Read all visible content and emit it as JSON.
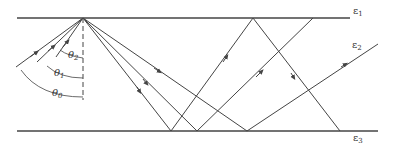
{
  "diagram": {
    "colors": {
      "line": "#444444",
      "background": "#ffffff"
    },
    "layers": [
      {
        "label_base": "ε",
        "label_sub": "1",
        "position": "upper medium"
      },
      {
        "label_base": "ε",
        "label_sub": "2",
        "position": "middle layer"
      },
      {
        "label_base": "ε",
        "label_sub": "3",
        "position": "lower medium"
      }
    ],
    "angles": [
      {
        "label_base": "θ",
        "label_sub": "2"
      },
      {
        "label_base": "θ",
        "label_sub": "1"
      },
      {
        "label_base": "θ",
        "label_sub": "0"
      }
    ],
    "boundaries": [
      {
        "name": "top-boundary",
        "x1": 17,
        "y1": 18,
        "x2": 350,
        "y2": 18
      },
      {
        "name": "bottom-boundary",
        "x1": 17,
        "y1": 131,
        "x2": 378,
        "y2": 131
      }
    ],
    "apex": {
      "x": 83,
      "y": 18
    },
    "incident_rays": [
      {
        "from": [
          16,
          67
        ],
        "to": [
          83,
          18
        ]
      },
      {
        "from": [
          37,
          62
        ],
        "to": [
          83,
          18
        ]
      },
      {
        "from": [
          56,
          57
        ],
        "to": [
          83,
          18
        ]
      }
    ],
    "reflected_rays": [
      {
        "from": [
          83,
          18
        ],
        "to": [
          171,
          131
        ]
      },
      {
        "from": [
          83,
          18
        ],
        "to": [
          197,
          131
        ]
      },
      {
        "from": [
          83,
          18
        ],
        "to": [
          247,
          131
        ]
      },
      {
        "from": [
          171,
          131
        ],
        "to": [
          253,
          18
        ]
      },
      {
        "from": [
          197,
          131
        ],
        "to": [
          313,
          18
        ]
      },
      {
        "from": [
          253,
          18
        ],
        "to": [
          340,
          131
        ]
      },
      {
        "from": [
          247,
          131
        ],
        "to": [
          378,
          44
        ]
      }
    ]
  }
}
